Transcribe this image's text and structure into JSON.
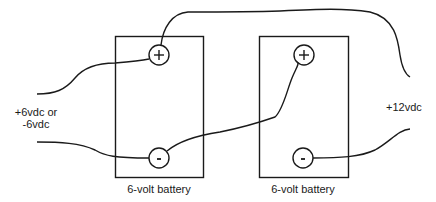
{
  "diagram": {
    "type": "wiring-diagram",
    "colors": {
      "stroke": "#1a1a1a",
      "background": "#ffffff"
    },
    "batteries": [
      {
        "label": "6-volt battery",
        "positive_terminal": "+",
        "negative_terminal": "-"
      },
      {
        "label": "6-volt battery",
        "positive_terminal": "+",
        "negative_terminal": "-"
      }
    ],
    "left_output": {
      "line1": "+6vdc or",
      "line2": "-6vdc"
    },
    "right_output": {
      "label": "+12vdc"
    }
  }
}
